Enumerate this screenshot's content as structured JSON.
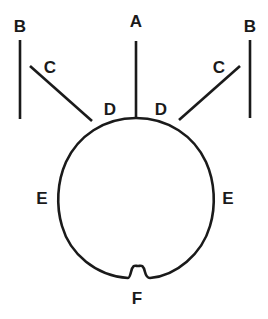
{
  "diagram": {
    "labels": {
      "A": "A",
      "B_left": "B",
      "B_right": "B",
      "C_left": "C",
      "C_right": "C",
      "D_left": "D",
      "D_right": "D",
      "E_left": "E",
      "E_right": "E",
      "F": "F"
    },
    "colors": {
      "stroke": "#1a1a1a",
      "background": "#ffffff"
    }
  }
}
